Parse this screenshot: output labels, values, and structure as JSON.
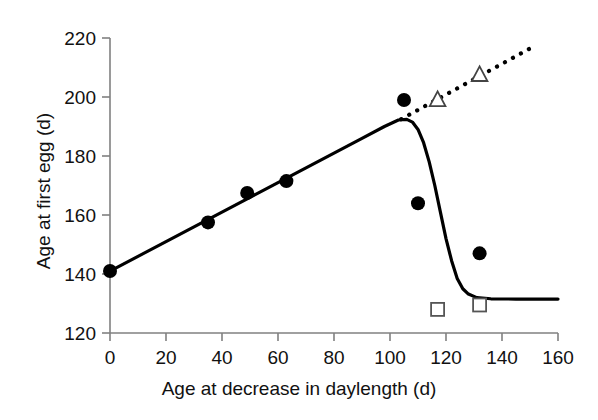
{
  "chart_data": {
    "type": "scatter",
    "title": "",
    "xlabel": "Age at decrease in daylength (d)",
    "ylabel": "Age at first egg (d)",
    "xlim": [
      0,
      160
    ],
    "ylim": [
      120,
      220
    ],
    "xticks": [
      0,
      20,
      40,
      60,
      80,
      100,
      120,
      140,
      160
    ],
    "yticks": [
      120,
      140,
      160,
      180,
      200,
      220
    ],
    "xtick_labels": [
      "0",
      "20",
      "40",
      "60",
      "80",
      "100",
      "120",
      "140",
      "160"
    ],
    "ytick_labels": [
      "120",
      "140",
      "160",
      "180",
      "200",
      "220"
    ],
    "grid": false,
    "legend": "none",
    "series": [
      {
        "name": "filled-circles",
        "marker": "filled-circle",
        "color": "#000000",
        "points": [
          {
            "x": 0,
            "y": 141.0
          },
          {
            "x": 35,
            "y": 157.5
          },
          {
            "x": 49,
            "y": 167.5
          },
          {
            "x": 63,
            "y": 171.5
          },
          {
            "x": 105,
            "y": 199.0
          },
          {
            "x": 110,
            "y": 164.0
          },
          {
            "x": 132,
            "y": 147.0
          }
        ]
      },
      {
        "name": "open-triangles",
        "marker": "open-triangle",
        "color": "#000000",
        "points": [
          {
            "x": 117,
            "y": 199.0
          },
          {
            "x": 132,
            "y": 207.5
          }
        ]
      },
      {
        "name": "open-squares",
        "marker": "open-square",
        "color": "#000000",
        "points": [
          {
            "x": 117,
            "y": 128.0
          },
          {
            "x": 132,
            "y": 129.5
          }
        ]
      }
    ],
    "curves": [
      {
        "name": "solid-fitted-curve",
        "style": "solid",
        "color": "#000000",
        "points": [
          {
            "x": 0,
            "y": 141.0
          },
          {
            "x": 10,
            "y": 146.0
          },
          {
            "x": 20,
            "y": 151.0
          },
          {
            "x": 30,
            "y": 156.0
          },
          {
            "x": 40,
            "y": 161.0
          },
          {
            "x": 50,
            "y": 166.0
          },
          {
            "x": 60,
            "y": 171.0
          },
          {
            "x": 70,
            "y": 176.0
          },
          {
            "x": 80,
            "y": 181.0
          },
          {
            "x": 90,
            "y": 186.0
          },
          {
            "x": 98,
            "y": 190.0
          },
          {
            "x": 103,
            "y": 192.2
          },
          {
            "x": 106,
            "y": 192.4
          },
          {
            "x": 108,
            "y": 191.5
          },
          {
            "x": 110,
            "y": 189.0
          },
          {
            "x": 112,
            "y": 184.5
          },
          {
            "x": 114,
            "y": 178.0
          },
          {
            "x": 116,
            "y": 170.0
          },
          {
            "x": 118,
            "y": 161.0
          },
          {
            "x": 120,
            "y": 152.0
          },
          {
            "x": 122,
            "y": 144.5
          },
          {
            "x": 124,
            "y": 138.5
          },
          {
            "x": 126,
            "y": 135.0
          },
          {
            "x": 128,
            "y": 133.2
          },
          {
            "x": 131,
            "y": 132.0
          },
          {
            "x": 136,
            "y": 131.6
          },
          {
            "x": 145,
            "y": 131.5
          },
          {
            "x": 160,
            "y": 131.5
          }
        ]
      },
      {
        "name": "dotted-extrapolation-line",
        "style": "dotted",
        "color": "#000000",
        "points": [
          {
            "x": 104,
            "y": 192.5
          },
          {
            "x": 152,
            "y": 217.5
          }
        ]
      }
    ]
  },
  "axes": {
    "x_axis_label": "Age at decrease in daylength (d)",
    "y_axis_label": "Age at first egg (d)"
  }
}
